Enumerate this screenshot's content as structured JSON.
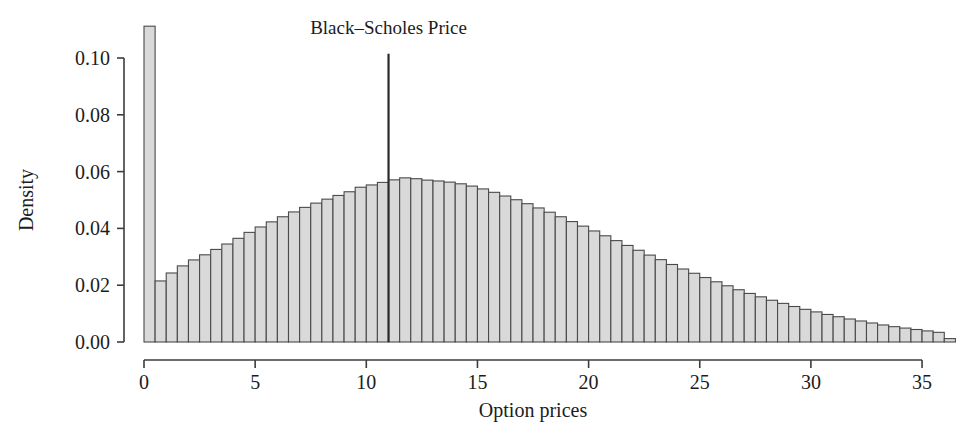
{
  "chart_data": {
    "type": "bar",
    "subtype": "histogram",
    "title": "",
    "xlabel": "Option prices",
    "ylabel": "Density",
    "xlim": [
      0,
      36.5
    ],
    "ylim": [
      0,
      0.1135
    ],
    "grid": false,
    "legend": null,
    "bin_width": 0.5,
    "bar_fill_color": "#d9d9d9",
    "bar_edge_color": "#4a4a4a",
    "xticks": [
      0,
      5,
      10,
      15,
      20,
      25,
      30,
      35
    ],
    "xtick_labels": [
      "0",
      "5",
      "10",
      "15",
      "20",
      "25",
      "30",
      "35"
    ],
    "yticks": [
      0.0,
      0.02,
      0.04,
      0.06,
      0.08,
      0.1
    ],
    "ytick_labels": [
      "0.00",
      "0.02",
      "0.04",
      "0.06",
      "0.08",
      "0.10"
    ],
    "annotations": [
      {
        "name": "black-scholes-price-line",
        "label": "Black–Scholes Price",
        "x": 11.0,
        "y_top": 0.1015,
        "color": "#2a2a2a",
        "label_x": 11.0,
        "label_y": 0.1085
      }
    ],
    "bin_starts": [
      0.0,
      0.5,
      1.0,
      1.5,
      2.0,
      2.5,
      3.0,
      3.5,
      4.0,
      4.5,
      5.0,
      5.5,
      6.0,
      6.5,
      7.0,
      7.5,
      8.0,
      8.5,
      9.0,
      9.5,
      10.0,
      10.5,
      11.0,
      11.5,
      12.0,
      12.5,
      13.0,
      13.5,
      14.0,
      14.5,
      15.0,
      15.5,
      16.0,
      16.5,
      17.0,
      17.5,
      18.0,
      18.5,
      19.0,
      19.5,
      20.0,
      20.5,
      21.0,
      21.5,
      22.0,
      22.5,
      23.0,
      23.5,
      24.0,
      24.5,
      25.0,
      25.5,
      26.0,
      26.5,
      27.0,
      27.5,
      28.0,
      28.5,
      29.0,
      29.5,
      30.0,
      30.5,
      31.0,
      31.5,
      32.0,
      32.5,
      33.0,
      33.5,
      34.0,
      34.5,
      35.0,
      35.5,
      36.0
    ],
    "values": [
      0.1112,
      0.0215,
      0.0243,
      0.0268,
      0.0289,
      0.0307,
      0.0326,
      0.0345,
      0.0365,
      0.0386,
      0.0405,
      0.0423,
      0.0441,
      0.0458,
      0.0474,
      0.0489,
      0.0503,
      0.0516,
      0.0529,
      0.0545,
      0.0553,
      0.0562,
      0.0571,
      0.0578,
      0.0575,
      0.057,
      0.0567,
      0.0563,
      0.0557,
      0.0549,
      0.0539,
      0.0527,
      0.0514,
      0.0501,
      0.0487,
      0.0472,
      0.0457,
      0.0441,
      0.0424,
      0.0408,
      0.0391,
      0.0374,
      0.0357,
      0.034,
      0.0323,
      0.0306,
      0.029,
      0.0273,
      0.0257,
      0.0242,
      0.0227,
      0.0212,
      0.0198,
      0.0184,
      0.0171,
      0.0159,
      0.0147,
      0.0136,
      0.0125,
      0.0115,
      0.0106,
      0.0097,
      0.0089,
      0.0081,
      0.0074,
      0.0067,
      0.006,
      0.0054,
      0.0049,
      0.0044,
      0.0039,
      0.0034,
      0.0012
    ]
  }
}
